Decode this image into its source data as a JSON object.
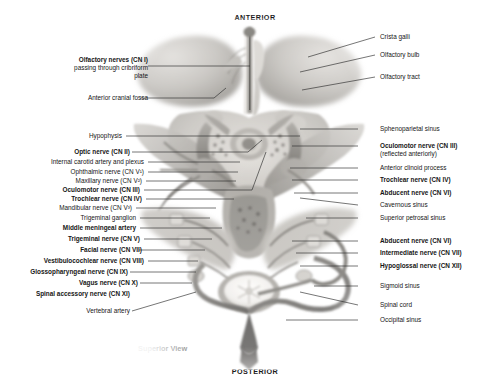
{
  "figure": {
    "orientation_top": "ANTERIOR",
    "orientation_bottom": "POSTERIOR",
    "view_caption": "Superior View",
    "style": "grayscale-pencil-anatomical-illustration"
  },
  "palette": {
    "background": "#ffffff",
    "text": "#161616",
    "leader_line": "#2b2b2b",
    "specimen_light": "#e8e6e3",
    "specimen_mid": "#b5b2ad",
    "specimen_dark": "#6e6b66",
    "specimen_darkest": "#3a3836",
    "bone_highlight": "#f4f2ef"
  },
  "labels_left": [
    {
      "id": "olfactory-nerves",
      "bold": true,
      "lines": [
        "Olfactory nerves (CN I)"
      ],
      "sublines": [
        "passing through cribriform",
        "plate"
      ]
    },
    {
      "id": "anterior-cranial-fossa",
      "bold": false,
      "lines": [
        "Anterior cranial fossa"
      ],
      "sublines": []
    },
    {
      "id": "hypophysis",
      "bold": false,
      "lines": [
        "Hypophysis"
      ],
      "sublines": []
    },
    {
      "id": "optic-nerve",
      "bold": true,
      "lines": [
        "Optic nerve (CN II)"
      ],
      "sublines": []
    },
    {
      "id": "internal-carotid-artery-and-plexus",
      "bold": false,
      "lines": [
        "Internal carotid artery and plexus"
      ],
      "sublines": []
    },
    {
      "id": "ophthalmic-nerve",
      "bold": false,
      "lines": [
        "Ophthalmic nerve (CN V¹)"
      ],
      "sublines": []
    },
    {
      "id": "maxillary-nerve",
      "bold": false,
      "lines": [
        "Maxillary nerve (CN V²)"
      ],
      "sublines": []
    },
    {
      "id": "oculomotor-nerve-left",
      "bold": true,
      "lines": [
        "Oculomotor nerve (CN III)"
      ],
      "sublines": []
    },
    {
      "id": "trochlear-nerve-left",
      "bold": true,
      "lines": [
        "Trochlear nerve (CN IV)"
      ],
      "sublines": []
    },
    {
      "id": "mandibular-nerve",
      "bold": false,
      "lines": [
        "Mandibular nerve (CN V³)"
      ],
      "sublines": []
    },
    {
      "id": "trigeminal-ganglion",
      "bold": false,
      "lines": [
        "Trigeminal ganglion"
      ],
      "sublines": []
    },
    {
      "id": "middle-meningeal-artery",
      "bold": true,
      "lines": [
        "Middle meningeal artery"
      ],
      "sublines": []
    },
    {
      "id": "trigeminal-nerve",
      "bold": true,
      "lines": [
        "Trigeminal nerve (CN V)"
      ],
      "sublines": []
    },
    {
      "id": "facial-nerve",
      "bold": true,
      "lines": [
        "Facial nerve (CN VII)"
      ],
      "sublines": []
    },
    {
      "id": "vestibulocochlear-nerve",
      "bold": true,
      "lines": [
        "Vestibulocochlear nerve (CN VIII)"
      ],
      "sublines": []
    },
    {
      "id": "glossopharyngeal-nerve",
      "bold": true,
      "lines": [
        "Glossopharyngeal nerve (CN IX)"
      ],
      "sublines": []
    },
    {
      "id": "vagus-nerve",
      "bold": true,
      "lines": [
        "Vagus nerve (CN X)"
      ],
      "sublines": []
    },
    {
      "id": "spinal-accessory-nerve",
      "bold": true,
      "lines": [
        "Spinal accessory nerve (CN XI)"
      ],
      "sublines": []
    },
    {
      "id": "vertebral-artery",
      "bold": false,
      "lines": [
        "Vertebral artery"
      ],
      "sublines": []
    }
  ],
  "labels_right": [
    {
      "id": "crista-galli",
      "bold": false,
      "lines": [
        "Crista galli"
      ],
      "sublines": []
    },
    {
      "id": "olfactory-bulb",
      "bold": false,
      "lines": [
        "Olfactory bulb"
      ],
      "sublines": []
    },
    {
      "id": "olfactory-tract",
      "bold": false,
      "lines": [
        "Olfactory tract"
      ],
      "sublines": []
    },
    {
      "id": "sphenoparietal-sinus",
      "bold": false,
      "lines": [
        "Sphenoparietal sinus"
      ],
      "sublines": []
    },
    {
      "id": "oculomotor-nerve-right",
      "bold": true,
      "lines": [
        "Oculomotor nerve (CN III)"
      ],
      "sublines": [
        "(reflected anteriorly)"
      ]
    },
    {
      "id": "anterior-clinoid-process",
      "bold": false,
      "lines": [
        "Anterior clinoid process"
      ],
      "sublines": []
    },
    {
      "id": "trochlear-nerve-right",
      "bold": true,
      "lines": [
        "Trochlear nerve (CN IV)"
      ],
      "sublines": []
    },
    {
      "id": "abducent-nerve-upper",
      "bold": true,
      "lines": [
        "Abducent nerve (CN VI)"
      ],
      "sublines": []
    },
    {
      "id": "cavernous-sinus",
      "bold": false,
      "lines": [
        "Cavernous sinus"
      ],
      "sublines": []
    },
    {
      "id": "superior-petrosal-sinus",
      "bold": false,
      "lines": [
        "Superior petrosal sinus"
      ],
      "sublines": []
    },
    {
      "id": "abducent-nerve-lower",
      "bold": true,
      "lines": [
        "Abducent nerve (CN VI)"
      ],
      "sublines": []
    },
    {
      "id": "intermediate-nerve",
      "bold": true,
      "lines": [
        "Intermediate nerve (CN VII)"
      ],
      "sublines": []
    },
    {
      "id": "hypoglossal-nerve",
      "bold": true,
      "lines": [
        "Hypoglossal nerve (CN XII)"
      ],
      "sublines": []
    },
    {
      "id": "sigmoid-sinus",
      "bold": false,
      "lines": [
        "Sigmoid sinus"
      ],
      "sublines": []
    },
    {
      "id": "spinal-cord",
      "bold": false,
      "lines": [
        "Spinal cord"
      ],
      "sublines": []
    },
    {
      "id": "occipital-sinus",
      "bold": false,
      "lines": [
        "Occipital sinus"
      ],
      "sublines": []
    }
  ]
}
